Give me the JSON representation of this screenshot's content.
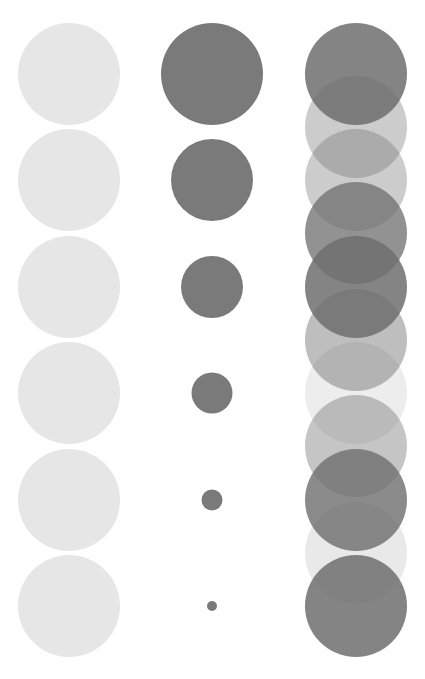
{
  "canvas": {
    "width": 425,
    "height": 679,
    "background": "#ffffff"
  },
  "columns": [
    {
      "name": "uniform-light",
      "color": "#e6e6e6",
      "cx": 69,
      "circles": [
        {
          "cy": 74,
          "r": 51,
          "opacity": 1
        },
        {
          "cy": 180,
          "r": 51,
          "opacity": 1
        },
        {
          "cy": 287,
          "r": 51,
          "opacity": 1
        },
        {
          "cy": 393,
          "r": 51,
          "opacity": 1
        },
        {
          "cy": 500,
          "r": 51,
          "opacity": 1
        },
        {
          "cy": 606,
          "r": 51,
          "opacity": 1
        }
      ]
    },
    {
      "name": "shrinking-size",
      "color": "#7a7a7a",
      "cx": 212,
      "circles": [
        {
          "cy": 74,
          "r": 51,
          "opacity": 1
        },
        {
          "cy": 180,
          "r": 41,
          "opacity": 1
        },
        {
          "cy": 287,
          "r": 31,
          "opacity": 1
        },
        {
          "cy": 393,
          "r": 20.5,
          "opacity": 1
        },
        {
          "cy": 500,
          "r": 10.5,
          "opacity": 1
        },
        {
          "cy": 606,
          "r": 5,
          "opacity": 1
        }
      ]
    },
    {
      "name": "overlapping-opacity",
      "color": "#6e6e6e",
      "cx": 356,
      "circles": [
        {
          "cy": 74,
          "r": 51,
          "opacity": 0.85
        },
        {
          "cy": 127,
          "r": 51,
          "opacity": 0.35
        },
        {
          "cy": 180,
          "r": 51,
          "opacity": 0.35
        },
        {
          "cy": 233,
          "r": 51,
          "opacity": 0.75
        },
        {
          "cy": 287,
          "r": 51,
          "opacity": 0.85
        },
        {
          "cy": 340,
          "r": 51,
          "opacity": 0.45
        },
        {
          "cy": 393,
          "r": 51,
          "opacity": 0.12
        },
        {
          "cy": 446,
          "r": 51,
          "opacity": 0.4
        },
        {
          "cy": 500,
          "r": 51,
          "opacity": 0.8
        },
        {
          "cy": 553,
          "r": 51,
          "opacity": 0.15
        },
        {
          "cy": 606,
          "r": 51,
          "opacity": 0.85
        }
      ]
    }
  ]
}
